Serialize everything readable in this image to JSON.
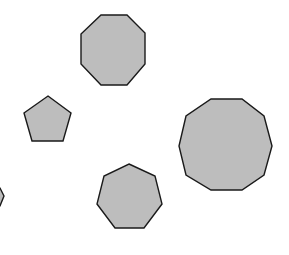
{
  "canvas": {
    "width": 289,
    "height": 255,
    "background": "#ffffff"
  },
  "style": {
    "fill": "#bdbdbd",
    "stroke": "#1a1a1a",
    "stroke_width": 1.4
  },
  "shapes": [
    {
      "name": "octagon",
      "sides": 8,
      "points": "101,15 127,15 145,33 145,64 127,85 101,85 81,64 81,34"
    },
    {
      "name": "pentagon",
      "sides": 5,
      "points": "48,96 71,113 63,141 32,141 24,113"
    },
    {
      "name": "decagon",
      "sides": 10,
      "points": "211,99 242,99 264,116 272,146 264,175 242,190 211,190 186,175 179,146 186,116"
    },
    {
      "name": "heptagon",
      "sides": 7,
      "points": "129,164 155,176 162,204 144,228 115,228 97,204 104,176"
    },
    {
      "name": "partial-polygon-left-edge",
      "sides": null,
      "points": "-10,186 0,188 4,196 0,206 -10,208"
    }
  ]
}
